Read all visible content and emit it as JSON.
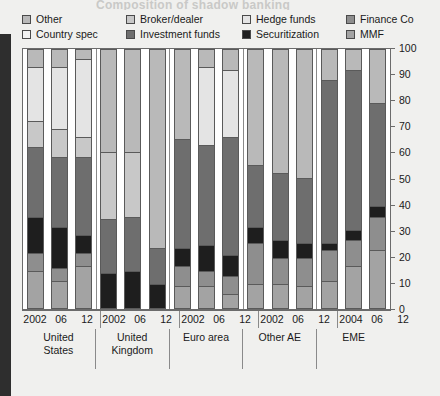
{
  "title_ghost": "Composition of shadow banking",
  "legend": {
    "rows": [
      [
        {
          "label": "Other",
          "color": "#b9b9b9",
          "name": "other"
        },
        {
          "label": "Broker/dealer",
          "color": "#c8c8c8",
          "name": "broker-dealer"
        },
        {
          "label": "Hedge funds",
          "color": "#e4e4e4",
          "name": "hedge-funds"
        },
        {
          "label": "Finance Co",
          "color": "#8e8e8e",
          "name": "finance-co"
        }
      ],
      [
        {
          "label": "Country spec",
          "color": "#f2f2f2",
          "name": "country-spec"
        },
        {
          "label": "Investment funds",
          "color": "#6e6e6e",
          "name": "investment-funds"
        },
        {
          "label": "Securitization",
          "color": "#1e1e1e",
          "name": "securitization"
        },
        {
          "label": "MMF",
          "color": "#a3a3a3",
          "name": "mmf"
        }
      ]
    ]
  },
  "yaxis": {
    "ticks": [
      0,
      10,
      20,
      30,
      40,
      50,
      60,
      70,
      80,
      90,
      100
    ],
    "min": 0,
    "max": 100
  },
  "colors": {
    "other": "#b9b9b9",
    "country_spec": "#f2f2f2",
    "broker_dealer": "#c8c8c8",
    "investment_funds": "#6e6e6e",
    "hedge_funds": "#e4e4e4",
    "securitization": "#1e1e1e",
    "finance_co": "#8e8e8e",
    "mmf": "#a3a3a3",
    "plot_bg": "#ffffff",
    "page_bg": "#f0f0ee",
    "axis": "#6b6b6b",
    "gutter": "#2e2e2e"
  },
  "chart_data": {
    "type": "bar",
    "subtype": "stacked-100",
    "title": "Composition of shadow banking",
    "xlabel": "",
    "ylabel": "",
    "ylim": [
      0,
      100
    ],
    "yticks": [
      0,
      10,
      20,
      30,
      40,
      50,
      60,
      70,
      80,
      90,
      100
    ],
    "grid": false,
    "legend_position": "top",
    "stack_order_bottom_to_top": [
      "MMF",
      "Finance Co",
      "Securitization",
      "Investment funds",
      "Broker/dealer",
      "Hedge funds",
      "Country spec",
      "Other"
    ],
    "series": [
      {
        "name": "MMF",
        "color": "#a3a3a3"
      },
      {
        "name": "Finance Co",
        "color": "#8e8e8e"
      },
      {
        "name": "Securitization",
        "color": "#1e1e1e"
      },
      {
        "name": "Investment funds",
        "color": "#6e6e6e"
      },
      {
        "name": "Broker/dealer",
        "color": "#c8c8c8"
      },
      {
        "name": "Hedge funds",
        "color": "#e4e4e4"
      },
      {
        "name": "Country spec",
        "color": "#f2f2f2"
      },
      {
        "name": "Other",
        "color": "#b9b9b9"
      }
    ],
    "groups": [
      {
        "name": "United States",
        "label_lines": [
          "United",
          "States"
        ],
        "bars": [
          {
            "x": "2002",
            "values": {
              "MMF": 14,
              "Finance Co": 7,
              "Securitization": 14,
              "Investment funds": 27,
              "Broker/dealer": 10,
              "Hedge funds": 21,
              "Country spec": 0,
              "Other": 7
            }
          },
          {
            "x": "06",
            "values": {
              "MMF": 10,
              "Finance Co": 5,
              "Securitization": 16,
              "Investment funds": 27,
              "Broker/dealer": 11,
              "Hedge funds": 24,
              "Country spec": 0,
              "Other": 7
            }
          },
          {
            "x": "12",
            "values": {
              "MMF": 16,
              "Finance Co": 5,
              "Securitization": 7,
              "Investment funds": 30,
              "Broker/dealer": 8,
              "Hedge funds": 30,
              "Country spec": 0,
              "Other": 4
            }
          }
        ]
      },
      {
        "name": "United Kingdom",
        "label_lines": [
          "United",
          "Kingdom"
        ],
        "bars": [
          {
            "x": "2002",
            "values": {
              "MMF": 0,
              "Finance Co": 0,
              "Securitization": 13,
              "Investment funds": 21,
              "Broker/dealer": 26,
              "Hedge funds": 0,
              "Country spec": 0,
              "Other": 40
            }
          },
          {
            "x": "06",
            "values": {
              "MMF": 0,
              "Finance Co": 0,
              "Securitization": 14,
              "Investment funds": 21,
              "Broker/dealer": 25,
              "Hedge funds": 0,
              "Country spec": 0,
              "Other": 40
            }
          },
          {
            "x": "12",
            "values": {
              "MMF": 0,
              "Finance Co": 0,
              "Securitization": 9,
              "Investment funds": 14,
              "Broker/dealer": 0,
              "Hedge funds": 0,
              "Country spec": 0,
              "Other": 77
            }
          }
        ]
      },
      {
        "name": "Euro area",
        "label_lines": [
          "Euro area"
        ],
        "bars": [
          {
            "x": "2002",
            "values": {
              "MMF": 8,
              "Finance Co": 8,
              "Securitization": 7,
              "Investment funds": 42,
              "Broker/dealer": 0,
              "Hedge funds": 0,
              "Country spec": 0,
              "Other": 35
            }
          },
          {
            "x": "06",
            "values": {
              "MMF": 8,
              "Finance Co": 6,
              "Securitization": 10,
              "Investment funds": 39,
              "Broker/dealer": 0,
              "Hedge funds": 30,
              "Country spec": 0,
              "Other": 7
            }
          },
          {
            "x": "12",
            "values": {
              "MMF": 5,
              "Finance Co": 7,
              "Securitization": 8,
              "Investment funds": 46,
              "Broker/dealer": 0,
              "Hedge funds": 26,
              "Country spec": 0,
              "Other": 8
            }
          }
        ]
      },
      {
        "name": "Other AE",
        "label_lines": [
          "Other AE"
        ],
        "bars": [
          {
            "x": "2002",
            "values": {
              "MMF": 9,
              "Finance Co": 16,
              "Securitization": 6,
              "Investment funds": 24,
              "Broker/dealer": 0,
              "Hedge funds": 0,
              "Country spec": 0,
              "Other": 45
            }
          },
          {
            "x": "06",
            "values": {
              "MMF": 9,
              "Finance Co": 10,
              "Securitization": 7,
              "Investment funds": 26,
              "Broker/dealer": 0,
              "Hedge funds": 0,
              "Country spec": 0,
              "Other": 48
            }
          },
          {
            "x": "12",
            "values": {
              "MMF": 8,
              "Finance Co": 11,
              "Securitization": 6,
              "Investment funds": 25,
              "Broker/dealer": 0,
              "Hedge funds": 0,
              "Country spec": 0,
              "Other": 50
            }
          }
        ]
      },
      {
        "name": "EME",
        "label_lines": [
          "EME"
        ],
        "bars": [
          {
            "x": "2004",
            "values": {
              "MMF": 10,
              "Finance Co": 12,
              "Securitization": 3,
              "Investment funds": 63,
              "Broker/dealer": 0,
              "Hedge funds": 0,
              "Country spec": 0,
              "Other": 12
            }
          },
          {
            "x": "06",
            "values": {
              "MMF": 16,
              "Finance Co": 10,
              "Securitization": 4,
              "Investment funds": 62,
              "Broker/dealer": 0,
              "Hedge funds": 0,
              "Country spec": 0,
              "Other": 8
            }
          },
          {
            "x": "12",
            "values": {
              "MMF": 22,
              "Finance Co": 13,
              "Securitization": 4,
              "Investment funds": 40,
              "Broker/dealer": 0,
              "Hedge funds": 0,
              "Country spec": 0,
              "Other": 21
            }
          }
        ]
      }
    ]
  }
}
